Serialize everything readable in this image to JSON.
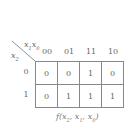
{
  "kmap": {
    "column_variables": "x1x0",
    "row_variable": "x2",
    "column_headers": [
      "00",
      "01",
      "11",
      "10"
    ],
    "row_headers": [
      "0",
      "1"
    ],
    "cells": [
      [
        "0",
        "0",
        "1",
        "0"
      ],
      [
        "0",
        "1",
        "1",
        "1"
      ]
    ],
    "function_label": "f(x2, x1, x0)"
  },
  "colors": {
    "line": "#888888",
    "text": "#666666",
    "background": "#ffffff"
  }
}
